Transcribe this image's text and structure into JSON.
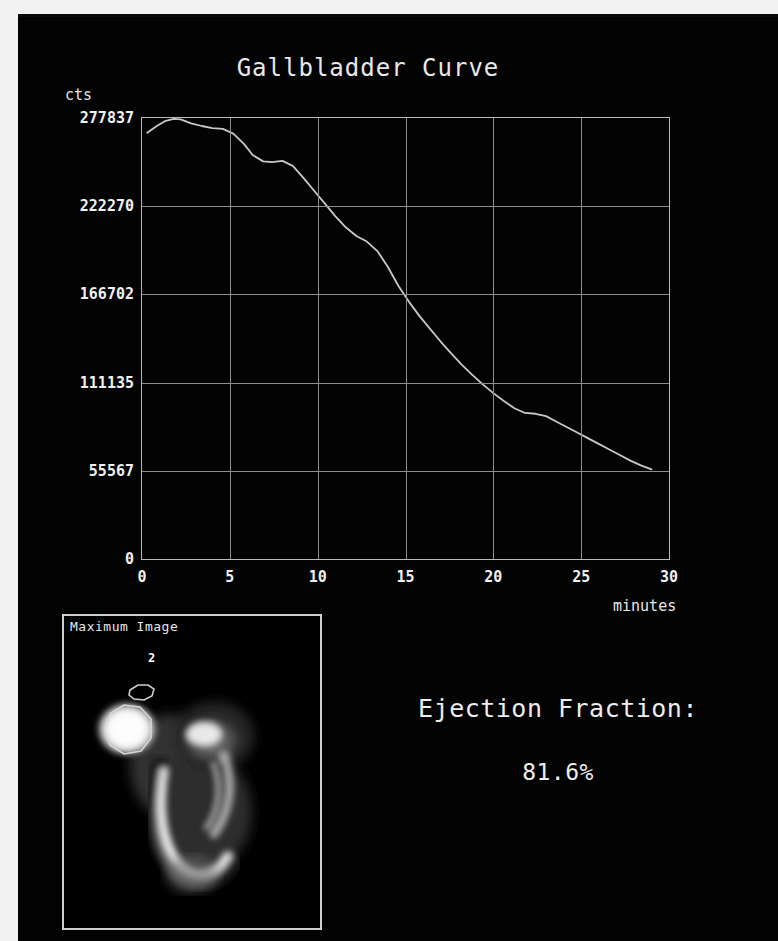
{
  "report": {
    "title": "Gallbladder Curve",
    "ejection_fraction_label": "Ejection Fraction:",
    "ejection_fraction_value": "81.6%"
  },
  "image_panel": {
    "label": "Maximum Image",
    "roi_number": "2"
  },
  "chart_data": {
    "type": "line",
    "title": "Gallbladder Curve",
    "xlabel": "minutes",
    "ylabel": "cts",
    "xlim": [
      0,
      30
    ],
    "ylim": [
      0,
      277837
    ],
    "grid": true,
    "legend": null,
    "xticks": [
      0,
      5,
      10,
      15,
      20,
      25,
      30
    ],
    "xtick_labels": [
      "0",
      "5",
      "10",
      "15",
      "20",
      "25",
      "30"
    ],
    "yticks": [
      0,
      55567,
      111135,
      166702,
      222270,
      277837
    ],
    "ytick_labels": [
      "0",
      "55567",
      "111135",
      "166702",
      "222270",
      "277837"
    ],
    "series": [
      {
        "name": "Gallbladder time-activity",
        "color": "#c8c8c8",
        "x": [
          0.3,
          0.8,
          1.3,
          1.8,
          2.2,
          2.8,
          3.4,
          4.0,
          4.6,
          5.2,
          5.8,
          6.3,
          6.9,
          7.4,
          8.0,
          8.6,
          9.2,
          9.8,
          10.4,
          11.0,
          11.6,
          12.2,
          12.8,
          13.4,
          14.0,
          14.6,
          15.2,
          15.8,
          16.4,
          17.0,
          17.6,
          18.2,
          18.8,
          19.4,
          20.0,
          20.6,
          21.2,
          21.8,
          22.4,
          23.0,
          23.6,
          24.2,
          24.8,
          25.4,
          26.0,
          26.6,
          27.2,
          27.8,
          28.4,
          29.0
        ],
        "y": [
          268500,
          272500,
          275800,
          277300,
          277000,
          274500,
          272800,
          271500,
          271000,
          268000,
          261500,
          254500,
          250500,
          250000,
          250800,
          247500,
          240000,
          232000,
          224000,
          216000,
          209000,
          203500,
          200000,
          194000,
          184000,
          172000,
          162000,
          153000,
          145000,
          137000,
          129500,
          122500,
          116000,
          110000,
          104500,
          99500,
          95000,
          92000,
          91500,
          90000,
          86500,
          83000,
          79500,
          76000,
          72500,
          69000,
          65500,
          62000,
          59000,
          56500
        ]
      }
    ],
    "annotations": [
      {
        "text": "Peak activity near 2 minutes",
        "x": 2.0,
        "y": 277300
      },
      {
        "text": "Terminal count at end of acquisition",
        "x": 29.0,
        "y": 56500
      }
    ]
  }
}
